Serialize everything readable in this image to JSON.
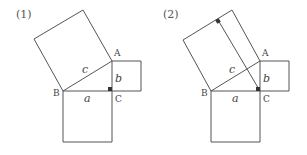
{
  "figures": [
    {
      "label": "(1)",
      "points": {
        "A": "A",
        "B": "B",
        "C": "C"
      },
      "sides": {
        "a": "a",
        "b": "b",
        "c": "c"
      },
      "has_altitude": false
    },
    {
      "label": "(2)",
      "points": {
        "A": "A",
        "B": "B",
        "C": "C"
      },
      "sides": {
        "a": "a",
        "b": "b",
        "c": "c"
      },
      "has_altitude": true
    }
  ],
  "colors": {
    "stroke": "#555555",
    "mark": "#333333"
  }
}
